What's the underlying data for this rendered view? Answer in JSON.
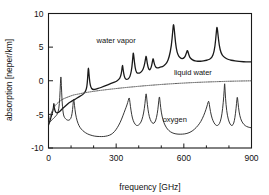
{
  "chart_data": {
    "type": "line",
    "title": "",
    "xlabel": "frequency [GHz]",
    "ylabel": "absorption [neper/km]",
    "xlim": [
      0,
      900
    ],
    "ylim": [
      -10,
      10
    ],
    "xticks": [
      0,
      300,
      600,
      900
    ],
    "xtick_labels": [
      "0",
      "300",
      "600",
      "900"
    ],
    "xminor_ticks": [
      100,
      200,
      400,
      500,
      700,
      800
    ],
    "yticks": [
      10,
      5,
      0,
      -5,
      -10
    ],
    "ytick_labels": [
      "10",
      "5",
      "0",
      "-5",
      "-10"
    ],
    "grid": false,
    "legend": "inline-annotations",
    "annotations": [
      {
        "text": "water vapor",
        "x": 300,
        "y": 5.6
      },
      {
        "text": "liquid water",
        "x": 640,
        "y": 0.9
      },
      {
        "text": "oxygen",
        "x": 560,
        "y": -6.1
      }
    ],
    "series": [
      {
        "name": "water vapor",
        "style": "solid",
        "color": "#1a1a1a",
        "linewidth": 1.3,
        "points": [
          [
            0,
            -6.6
          ],
          [
            6,
            -6.0
          ],
          [
            12,
            -5.3
          ],
          [
            18,
            -4.7
          ],
          [
            22,
            -4.0
          ],
          [
            24,
            -3.2
          ],
          [
            26,
            -4.1
          ],
          [
            30,
            -4.6
          ],
          [
            36,
            -4.8
          ],
          [
            44,
            -4.7
          ],
          [
            52,
            -4.5
          ],
          [
            60,
            -4.2
          ],
          [
            70,
            -3.9
          ],
          [
            80,
            -3.6
          ],
          [
            90,
            -3.3
          ],
          [
            100,
            -3.1
          ],
          [
            110,
            -2.9
          ],
          [
            120,
            -2.7
          ],
          [
            130,
            -2.5
          ],
          [
            140,
            -2.3
          ],
          [
            150,
            -2.1
          ],
          [
            160,
            -1.8
          ],
          [
            168,
            -1.3
          ],
          [
            172,
            -0.4
          ],
          [
            175,
            1.2
          ],
          [
            177,
            2.1
          ],
          [
            179,
            1.2
          ],
          [
            183,
            -0.3
          ],
          [
            188,
            -1.0
          ],
          [
            195,
            -1.3
          ],
          [
            205,
            -1.3
          ],
          [
            215,
            -1.2
          ],
          [
            225,
            -1.1
          ],
          [
            240,
            -0.9
          ],
          [
            255,
            -0.7
          ],
          [
            270,
            -0.5
          ],
          [
            285,
            -0.3
          ],
          [
            300,
            -0.1
          ],
          [
            312,
            0.2
          ],
          [
            320,
            0.6
          ],
          [
            325,
            1.5
          ],
          [
            328,
            2.5
          ],
          [
            331,
            1.6
          ],
          [
            336,
            0.6
          ],
          [
            342,
            0.2
          ],
          [
            350,
            0.2
          ],
          [
            358,
            0.4
          ],
          [
            364,
            0.9
          ],
          [
            370,
            2.0
          ],
          [
            374,
            3.6
          ],
          [
            376,
            4.3
          ],
          [
            379,
            3.4
          ],
          [
            384,
            1.9
          ],
          [
            390,
            1.2
          ],
          [
            398,
            1.1
          ],
          [
            408,
            1.2
          ],
          [
            416,
            1.5
          ],
          [
            424,
            2.1
          ],
          [
            430,
            3.2
          ],
          [
            433,
            3.8
          ],
          [
            436,
            3.0
          ],
          [
            441,
            2.0
          ],
          [
            447,
            1.6
          ],
          [
            452,
            1.7
          ],
          [
            457,
            2.2
          ],
          [
            461,
            2.9
          ],
          [
            464,
            3.4
          ],
          [
            467,
            2.8
          ],
          [
            472,
            2.2
          ],
          [
            478,
            1.9
          ],
          [
            486,
            1.9
          ],
          [
            495,
            2.0
          ],
          [
            505,
            2.1
          ],
          [
            515,
            2.3
          ],
          [
            525,
            2.7
          ],
          [
            535,
            3.5
          ],
          [
            545,
            5.2
          ],
          [
            551,
            7.4
          ],
          [
            554,
            8.6
          ],
          [
            558,
            7.6
          ],
          [
            563,
            5.6
          ],
          [
            570,
            4.2
          ],
          [
            578,
            3.6
          ],
          [
            588,
            3.3
          ],
          [
            598,
            3.3
          ],
          [
            606,
            3.6
          ],
          [
            612,
            4.2
          ],
          [
            616,
            4.6
          ],
          [
            620,
            4.1
          ],
          [
            626,
            3.5
          ],
          [
            634,
            3.2
          ],
          [
            644,
            3.0
          ],
          [
            656,
            2.9
          ],
          [
            668,
            2.9
          ],
          [
            680,
            2.9
          ],
          [
            694,
            3.0
          ],
          [
            708,
            3.1
          ],
          [
            720,
            3.3
          ],
          [
            730,
            3.8
          ],
          [
            738,
            5.0
          ],
          [
            744,
            7.2
          ],
          [
            747,
            8.2
          ],
          [
            751,
            7.0
          ],
          [
            757,
            5.2
          ],
          [
            765,
            4.1
          ],
          [
            775,
            3.6
          ],
          [
            788,
            3.3
          ],
          [
            802,
            3.1
          ],
          [
            818,
            3.0
          ],
          [
            835,
            2.9
          ],
          [
            855,
            2.85
          ],
          [
            875,
            2.8
          ],
          [
            900,
            2.8
          ]
        ]
      },
      {
        "name": "liquid water",
        "style": "dotted",
        "color": "#555555",
        "linewidth": 1.0,
        "points": [
          [
            0,
            -6.3
          ],
          [
            5,
            -5.6
          ],
          [
            10,
            -5.0
          ],
          [
            16,
            -4.5
          ],
          [
            22,
            -4.1
          ],
          [
            30,
            -3.7
          ],
          [
            40,
            -3.3
          ],
          [
            52,
            -3.0
          ],
          [
            65,
            -2.7
          ],
          [
            80,
            -2.5
          ],
          [
            95,
            -2.3
          ],
          [
            112,
            -2.1
          ],
          [
            130,
            -2.0
          ],
          [
            150,
            -1.85
          ],
          [
            172,
            -1.72
          ],
          [
            195,
            -1.6
          ],
          [
            220,
            -1.48
          ],
          [
            248,
            -1.36
          ],
          [
            278,
            -1.24
          ],
          [
            310,
            -1.12
          ],
          [
            344,
            -1.0
          ],
          [
            380,
            -0.89
          ],
          [
            418,
            -0.77
          ],
          [
            458,
            -0.66
          ],
          [
            500,
            -0.55
          ],
          [
            545,
            -0.45
          ],
          [
            592,
            -0.36
          ],
          [
            640,
            -0.27
          ],
          [
            690,
            -0.2
          ],
          [
            742,
            -0.14
          ],
          [
            795,
            -0.08
          ],
          [
            848,
            -0.04
          ],
          [
            900,
            -0.01
          ]
        ]
      },
      {
        "name": "oxygen",
        "style": "solid",
        "color": "#2b2b2b",
        "linewidth": 0.95,
        "points": [
          [
            0,
            -6.4
          ],
          [
            5,
            -6.2
          ],
          [
            10,
            -6.0
          ],
          [
            16,
            -5.8
          ],
          [
            22,
            -5.6
          ],
          [
            28,
            -5.4
          ],
          [
            34,
            -5.2
          ],
          [
            40,
            -4.9
          ],
          [
            46,
            -4.2
          ],
          [
            50,
            -2.6
          ],
          [
            53,
            -0.3
          ],
          [
            55,
            0.9
          ],
          [
            57,
            -0.6
          ],
          [
            60,
            -3.0
          ],
          [
            64,
            -4.6
          ],
          [
            68,
            -5.3
          ],
          [
            74,
            -5.6
          ],
          [
            80,
            -5.8
          ],
          [
            88,
            -5.9
          ],
          [
            95,
            -5.8
          ],
          [
            102,
            -5.4
          ],
          [
            107,
            -4.3
          ],
          [
            110,
            -3.0
          ],
          [
            112,
            -2.6
          ],
          [
            115,
            -3.6
          ],
          [
            120,
            -5.0
          ],
          [
            127,
            -6.0
          ],
          [
            135,
            -6.7
          ],
          [
            145,
            -7.2
          ],
          [
            158,
            -7.6
          ],
          [
            172,
            -7.9
          ],
          [
            188,
            -8.1
          ],
          [
            205,
            -8.25
          ],
          [
            225,
            -8.3
          ],
          [
            245,
            -8.3
          ],
          [
            262,
            -8.2
          ],
          [
            278,
            -8.0
          ],
          [
            292,
            -7.6
          ],
          [
            305,
            -7.0
          ],
          [
            318,
            -6.2
          ],
          [
            330,
            -5.2
          ],
          [
            340,
            -4.3
          ],
          [
            348,
            -3.6
          ],
          [
            354,
            -2.9
          ],
          [
            358,
            -2.4
          ],
          [
            361,
            -3.2
          ],
          [
            366,
            -4.5
          ],
          [
            372,
            -5.6
          ],
          [
            380,
            -6.3
          ],
          [
            390,
            -6.7
          ],
          [
            400,
            -6.6
          ],
          [
            410,
            -6.2
          ],
          [
            418,
            -5.4
          ],
          [
            425,
            -4.2
          ],
          [
            430,
            -2.6
          ],
          [
            433,
            -1.7
          ],
          [
            436,
            -2.8
          ],
          [
            441,
            -4.3
          ],
          [
            447,
            -5.4
          ],
          [
            455,
            -6.1
          ],
          [
            464,
            -6.4
          ],
          [
            472,
            -6.2
          ],
          [
            479,
            -5.5
          ],
          [
            485,
            -4.3
          ],
          [
            489,
            -2.9
          ],
          [
            492,
            -2.2
          ],
          [
            495,
            -3.3
          ],
          [
            500,
            -4.7
          ],
          [
            507,
            -5.8
          ],
          [
            516,
            -6.6
          ],
          [
            527,
            -7.2
          ],
          [
            540,
            -7.6
          ],
          [
            556,
            -7.85
          ],
          [
            574,
            -7.95
          ],
          [
            594,
            -7.95
          ],
          [
            614,
            -7.85
          ],
          [
            632,
            -7.6
          ],
          [
            648,
            -7.2
          ],
          [
            662,
            -6.7
          ],
          [
            675,
            -6.1
          ],
          [
            688,
            -5.2
          ],
          [
            698,
            -4.3
          ],
          [
            705,
            -3.5
          ],
          [
            710,
            -2.9
          ],
          [
            713,
            -3.5
          ],
          [
            718,
            -4.6
          ],
          [
            725,
            -5.6
          ],
          [
            734,
            -6.3
          ],
          [
            744,
            -6.7
          ],
          [
            754,
            -6.6
          ],
          [
            762,
            -6.1
          ],
          [
            769,
            -5.0
          ],
          [
            775,
            -3.2
          ],
          [
            779,
            -1.4
          ],
          [
            781,
            -0.1
          ],
          [
            783,
            -1.6
          ],
          [
            787,
            -3.6
          ],
          [
            793,
            -5.2
          ],
          [
            801,
            -6.2
          ],
          [
            810,
            -6.7
          ],
          [
            818,
            -6.6
          ],
          [
            824,
            -6.0
          ],
          [
            829,
            -4.9
          ],
          [
            834,
            -3.3
          ],
          [
            837,
            -2.2
          ],
          [
            840,
            -3.2
          ],
          [
            845,
            -4.7
          ],
          [
            852,
            -5.7
          ],
          [
            861,
            -6.3
          ],
          [
            872,
            -6.7
          ],
          [
            885,
            -6.9
          ],
          [
            900,
            -7.0
          ]
        ]
      }
    ]
  }
}
